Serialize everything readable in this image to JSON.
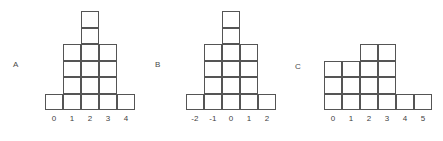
{
  "figure": {
    "background_color": "#ffffff",
    "stroke_color": "#555555",
    "label_color": "#3f3f3f",
    "cell_width": 18,
    "cell_height": 16.5
  },
  "panels": [
    {
      "letter": "A",
      "letter_x": 13,
      "letter_y": 61,
      "origin_x": 45,
      "baseline_y": 110,
      "chart_data": {
        "type": "bar",
        "title": "A",
        "xlabel": "",
        "ylabel": "",
        "categories": [
          "0",
          "1",
          "2",
          "3",
          "4"
        ],
        "values": [
          1,
          4,
          6,
          4,
          1
        ],
        "ylim": [
          0,
          6
        ],
        "grid": false,
        "legend": "none",
        "note": "block-unit histogram; each unit square equals one count"
      }
    },
    {
      "letter": "B",
      "letter_x": 155,
      "letter_y": 61,
      "origin_x": 186,
      "baseline_y": 110,
      "chart_data": {
        "type": "bar",
        "title": "B",
        "xlabel": "",
        "ylabel": "",
        "categories": [
          "-2",
          "-1",
          "0",
          "1",
          "2"
        ],
        "values": [
          1,
          4,
          6,
          4,
          1
        ],
        "ylim": [
          0,
          6
        ],
        "grid": false,
        "legend": "none",
        "note": "block-unit histogram; same shape as A with shifted axis origin"
      }
    },
    {
      "letter": "C",
      "letter_x": 295,
      "letter_y": 63,
      "origin_x": 324,
      "baseline_y": 110,
      "chart_data": {
        "type": "bar",
        "title": "C",
        "xlabel": "",
        "ylabel": "",
        "categories": [
          "0",
          "1",
          "2",
          "3",
          "4",
          "5"
        ],
        "values": [
          3,
          3,
          4,
          4,
          1,
          1
        ],
        "ylim": [
          0,
          4
        ],
        "grid": false,
        "legend": "none",
        "note": "block-unit histogram; asymmetric stepped distribution"
      }
    }
  ]
}
